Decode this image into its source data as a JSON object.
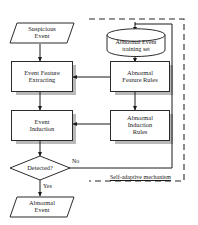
{
  "diagram": {
    "colors": {
      "stroke": "#2b2b2b",
      "shadow": "#b9b9b9",
      "dashed_border": "#2b2b2b",
      "background": "#ffffff"
    },
    "nodes": {
      "suspicious_event": {
        "shape": "parallelogram",
        "line1": "Suspicious",
        "line2": "Event"
      },
      "event_feature_extracting": {
        "shape": "process",
        "line1": "Event Feature",
        "line2": "Extracting"
      },
      "event_induction": {
        "shape": "process",
        "line1": "Event",
        "line2": "Induction"
      },
      "detected": {
        "shape": "decision",
        "line1": "Detected?"
      },
      "abnormal_event_output": {
        "shape": "parallelogram",
        "line1": "Abnormal",
        "line2": "Event"
      },
      "training_set": {
        "shape": "database",
        "line1": "Abnormal Event",
        "line2": "training set"
      },
      "abnormal_feature_rules": {
        "shape": "process",
        "line1": "Abnormal",
        "line2": "Feature Rules"
      },
      "abnormal_induction_rules": {
        "shape": "process",
        "line1": "Abnormal",
        "line2": "Induction",
        "line3": "Rules"
      }
    },
    "edge_labels": {
      "no": "No",
      "yes": "Yes"
    },
    "group_label": "Self-adaptive mechanism"
  }
}
